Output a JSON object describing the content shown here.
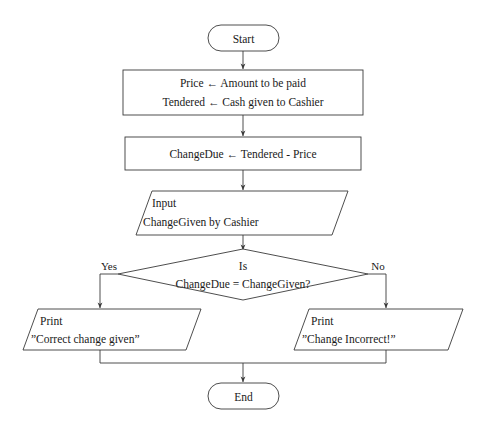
{
  "diagram": {
    "type": "flowchart",
    "nodes": {
      "start": {
        "kind": "terminator",
        "label": "Start"
      },
      "init": {
        "kind": "process",
        "line1": "Price ← Amount to be paid",
        "line2": "Tendered ← Cash given to Cashier"
      },
      "compute": {
        "kind": "process",
        "line1": "ChangeDue ← Tendered - Price"
      },
      "input": {
        "kind": "input",
        "line1": "Input",
        "line2": "ChangeGiven by Cashier"
      },
      "decision": {
        "kind": "decision",
        "line1": "Is",
        "line2": "ChangeDue = ChangeGiven?"
      },
      "output_yes": {
        "kind": "output",
        "line1": "Print",
        "line2": "”Correct change given”"
      },
      "output_no": {
        "kind": "output",
        "line1": "Print",
        "line2": "”Change Incorrect!”"
      },
      "end": {
        "kind": "terminator",
        "label": "End"
      }
    },
    "edges": {
      "yes_label": "Yes",
      "no_label": "No"
    },
    "colors": {
      "stroke": "#3a3a3a",
      "text": "#1a1a1a",
      "background": "#ffffff"
    }
  }
}
